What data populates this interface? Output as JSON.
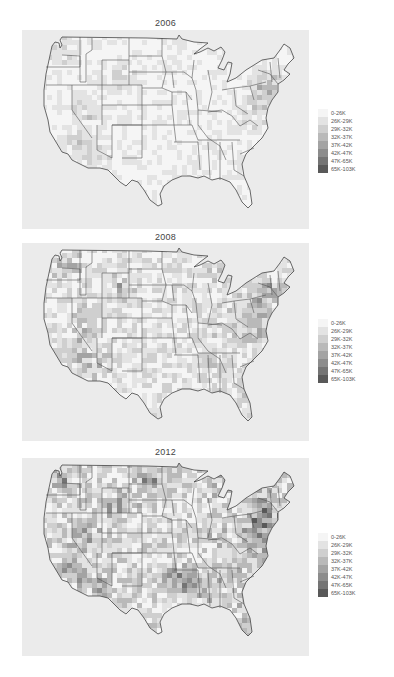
{
  "chart_data": [
    {
      "type": "heatmap",
      "subtype": "choropleth-map",
      "title": "2006",
      "xlabel": "",
      "ylabel": "",
      "region": "Contiguous United States (county level)",
      "legend": {
        "position": "right",
        "categories": [
          "0-26K",
          "26K-29K",
          "29K-32K",
          "32K-37K",
          "37K-42K",
          "42K-47K",
          "47K-65K",
          "65K-103K"
        ],
        "colors": [
          "#f5f5f5",
          "#e3e3e3",
          "#cfcfcf",
          "#b9b9b9",
          "#a3a3a3",
          "#8c8c8c",
          "#747474",
          "#595959"
        ]
      },
      "notes": "Mostly light shades; darker counties in Nevada, Wyoming, California, Washington, Northeast corridor"
    },
    {
      "type": "heatmap",
      "subtype": "choropleth-map",
      "title": "2008",
      "xlabel": "",
      "ylabel": "",
      "region": "Contiguous United States (county level)",
      "legend": {
        "position": "right",
        "categories": [
          "0-26K",
          "26K-29K",
          "29K-32K",
          "32K-37K",
          "37K-42K",
          "42K-47K",
          "47K-65K",
          "65K-103K"
        ],
        "colors": [
          "#f5f5f5",
          "#e3e3e3",
          "#cfcfcf",
          "#b9b9b9",
          "#a3a3a3",
          "#8c8c8c",
          "#747474",
          "#595959"
        ]
      },
      "notes": "Moderately darker than 2006; Nevada, Wyoming, Arizona, Northeast darker"
    },
    {
      "type": "heatmap",
      "subtype": "choropleth-map",
      "title": "2012",
      "xlabel": "",
      "ylabel": "",
      "region": "Contiguous United States (county level)",
      "legend": {
        "position": "right",
        "categories": [
          "0-26K",
          "26K-29K",
          "29K-32K",
          "32K-37K",
          "37K-42K",
          "42K-47K",
          "47K-65K",
          "65K-103K"
        ],
        "colors": [
          "#f5f5f5",
          "#e3e3e3",
          "#cfcfcf",
          "#b9b9b9",
          "#a3a3a3",
          "#8c8c8c",
          "#747474",
          "#595959"
        ]
      },
      "notes": "Darkest overall; North Dakota, Nevada, Wyoming, Texas, Northeast darker"
    }
  ],
  "panels": [
    {
      "title": "2006",
      "top": 18,
      "plot_top": 30,
      "plot_h": 199,
      "legend_top": 109,
      "shade": 0.25
    },
    {
      "title": "2008",
      "top": 232,
      "plot_top": 243,
      "plot_h": 198,
      "legend_top": 319,
      "shade": 0.45
    },
    {
      "title": "2012",
      "top": 447,
      "plot_top": 458,
      "plot_h": 198,
      "legend_top": 533,
      "shade": 0.62
    }
  ]
}
